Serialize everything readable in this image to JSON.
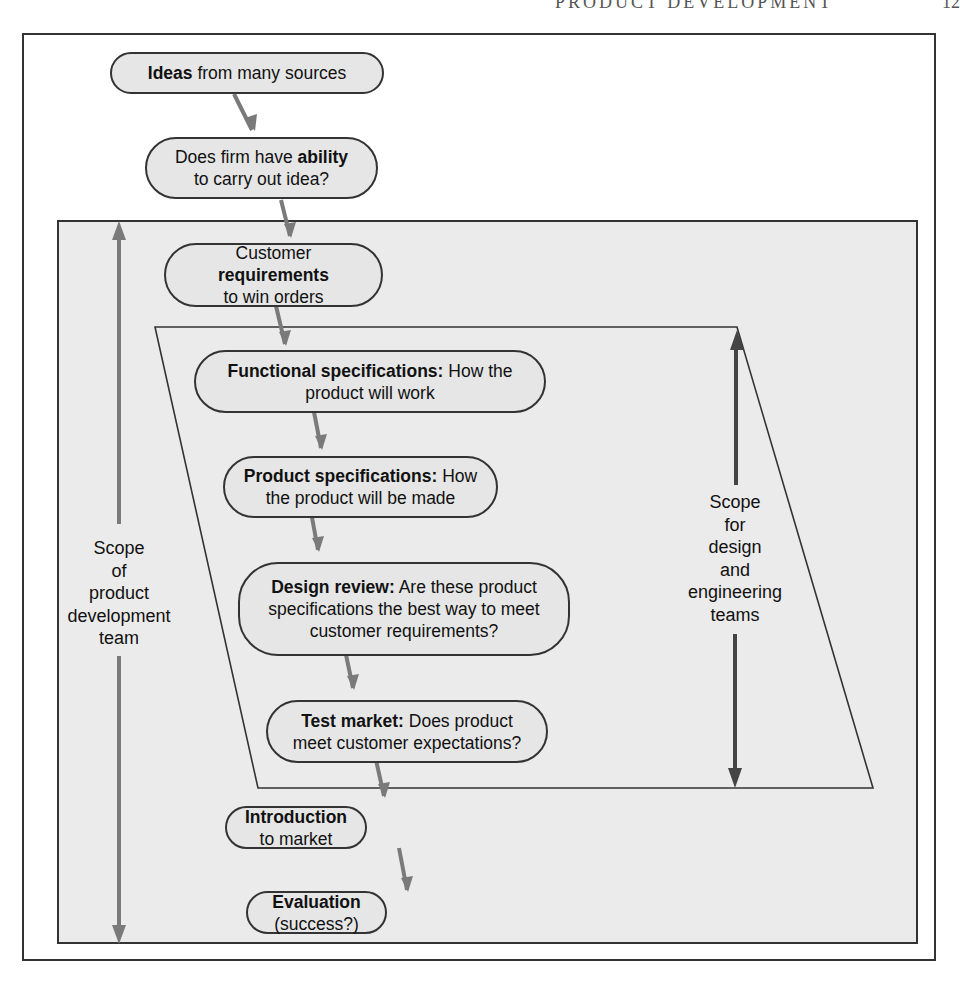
{
  "page": {
    "running_head": "PRODUCT DEVELOPMENT",
    "page_number": "12"
  },
  "flowchart": {
    "nodes": [
      {
        "id": "ideas",
        "bold": "Ideas",
        "rest": " from many sources"
      },
      {
        "id": "ability",
        "pre": "Does firm have ",
        "bold": "ability",
        "post": "to carry out idea?"
      },
      {
        "id": "requirements",
        "pre": "Customer ",
        "bold": "requirements",
        "post": "to win orders"
      },
      {
        "id": "functional",
        "bold": "Functional specifications:",
        "rest": " How the product will work"
      },
      {
        "id": "product_specs",
        "bold": "Product specifications:",
        "rest": " How the product will be made"
      },
      {
        "id": "design_review",
        "bold": "Design review:",
        "rest": " Are these product specifications the best way to meet customer requirements?"
      },
      {
        "id": "test_market",
        "bold": "Test market:",
        "rest": " Does product meet customer expectations?"
      },
      {
        "id": "introduction",
        "bold": "Introduction",
        "rest": " to market"
      },
      {
        "id": "evaluation",
        "bold": "Evaluation",
        "rest": " (success?)"
      }
    ],
    "scopes": {
      "product_team": {
        "lines": [
          "Scope",
          "of",
          "product",
          "development",
          "team"
        ]
      },
      "design_team": {
        "lines": [
          "Scope",
          "for",
          "design",
          "and",
          "engineering",
          "teams"
        ]
      }
    }
  },
  "colors": {
    "panel_bg": "#ebebeb",
    "node_bg": "#e6e6e6",
    "arrow": "#7a7a7a",
    "scope_arrow_design": "#444444"
  }
}
